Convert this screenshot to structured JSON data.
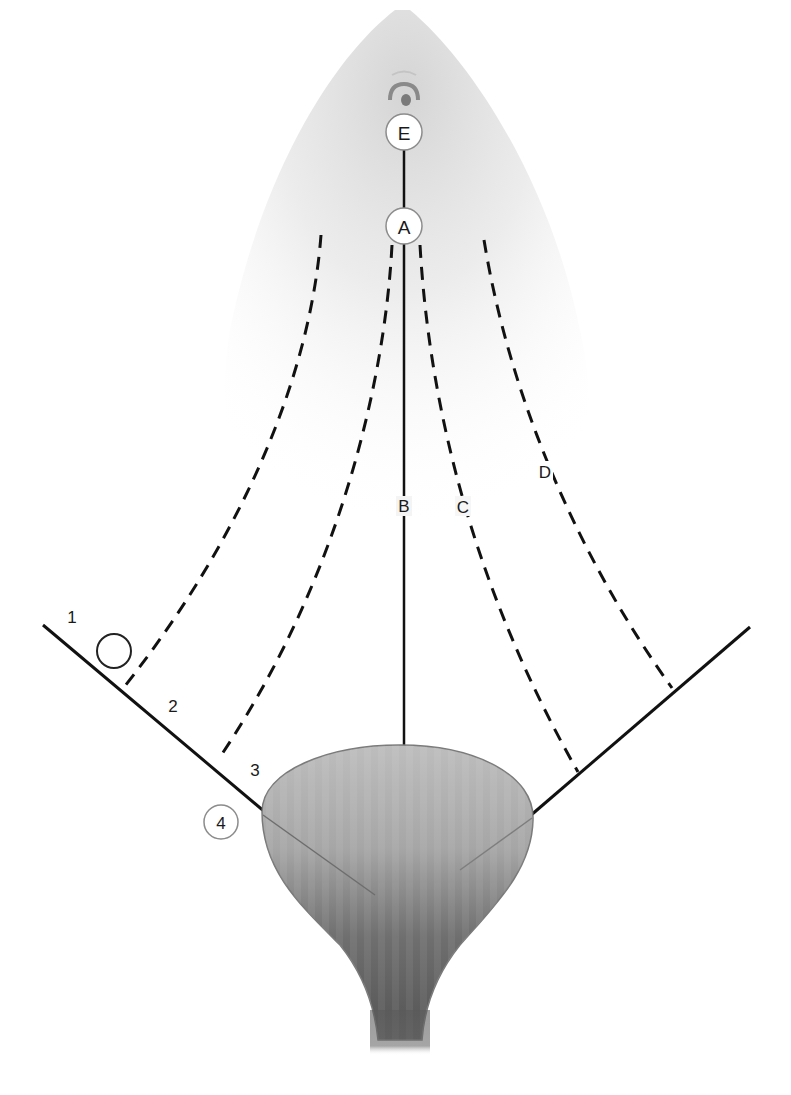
{
  "diagram": {
    "type": "anatomical-schematic",
    "colors": {
      "line": "#111111",
      "organ_light": "#b8b8b8",
      "organ_dark": "#5a5a5a",
      "haze": "#d9d9d9",
      "circle_fill": "#ffffff",
      "circle_stroke": "#888888"
    },
    "points": {
      "E": {
        "label": "E",
        "x": 404,
        "y": 132
      },
      "A": {
        "label": "A",
        "x": 404,
        "y": 226
      }
    },
    "paths": [
      {
        "id": "B",
        "label": "B",
        "style": "solid",
        "label_x": 404,
        "label_y": 506
      },
      {
        "id": "C",
        "label": "C",
        "style": "dashed",
        "label_x": 463,
        "label_y": 506
      },
      {
        "id": "D",
        "label": "D",
        "style": "dashed",
        "label_x": 545,
        "label_y": 471
      }
    ],
    "zone_numbers": [
      {
        "label": "1",
        "x": 72,
        "y": 617
      },
      {
        "label": "2",
        "x": 173,
        "y": 706
      },
      {
        "label": "3",
        "x": 255,
        "y": 770
      }
    ],
    "circled_number": {
      "label": "4",
      "x": 221,
      "y": 822
    },
    "marker_circle": {
      "x": 114,
      "y": 651,
      "r": 17
    }
  }
}
